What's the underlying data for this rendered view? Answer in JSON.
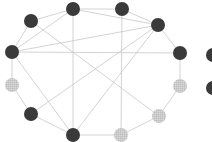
{
  "diagram": {
    "type": "network-graph",
    "colors": {
      "edge": "#c8c8c8",
      "dark_node": "#3a3a3a",
      "hatched_node_fill": "#d9d9d9",
      "hatched_node_grid": "#a8a8a8",
      "background": "#ffffff"
    },
    "node_radius": 7,
    "nodes": [
      {
        "id": "A",
        "x": 31,
        "y": 21,
        "style": "dark"
      },
      {
        "id": "B",
        "x": 73,
        "y": 9,
        "style": "dark"
      },
      {
        "id": "C",
        "x": 122,
        "y": 9,
        "style": "dark"
      },
      {
        "id": "D",
        "x": 158,
        "y": 25,
        "style": "dark"
      },
      {
        "id": "E",
        "x": 180,
        "y": 53,
        "style": "dark"
      },
      {
        "id": "F",
        "x": 180,
        "y": 86,
        "style": "hatched"
      },
      {
        "id": "G",
        "x": 159,
        "y": 116,
        "style": "hatched"
      },
      {
        "id": "H",
        "x": 121,
        "y": 135,
        "style": "hatched"
      },
      {
        "id": "I",
        "x": 73,
        "y": 135,
        "style": "dark"
      },
      {
        "id": "J",
        "x": 31,
        "y": 114,
        "style": "dark"
      },
      {
        "id": "K",
        "x": 12,
        "y": 85,
        "style": "hatched"
      },
      {
        "id": "L",
        "x": 12,
        "y": 52,
        "style": "dark"
      },
      {
        "id": "M",
        "x": 213,
        "y": 55,
        "style": "dark"
      },
      {
        "id": "N",
        "x": 213,
        "y": 88,
        "style": "dark"
      }
    ],
    "edges": [
      [
        "A",
        "B"
      ],
      [
        "B",
        "C"
      ],
      [
        "C",
        "D"
      ],
      [
        "D",
        "E"
      ],
      [
        "E",
        "F"
      ],
      [
        "F",
        "G"
      ],
      [
        "G",
        "H"
      ],
      [
        "H",
        "I"
      ],
      [
        "I",
        "J"
      ],
      [
        "J",
        "K"
      ],
      [
        "K",
        "L"
      ],
      [
        "L",
        "A"
      ],
      [
        "B",
        "L"
      ],
      [
        "B",
        "D"
      ],
      [
        "B",
        "I"
      ],
      [
        "C",
        "H"
      ],
      [
        "D",
        "L"
      ],
      [
        "D",
        "J"
      ],
      [
        "D",
        "I"
      ],
      [
        "L",
        "E"
      ],
      [
        "L",
        "I"
      ],
      [
        "A",
        "G"
      ]
    ]
  }
}
